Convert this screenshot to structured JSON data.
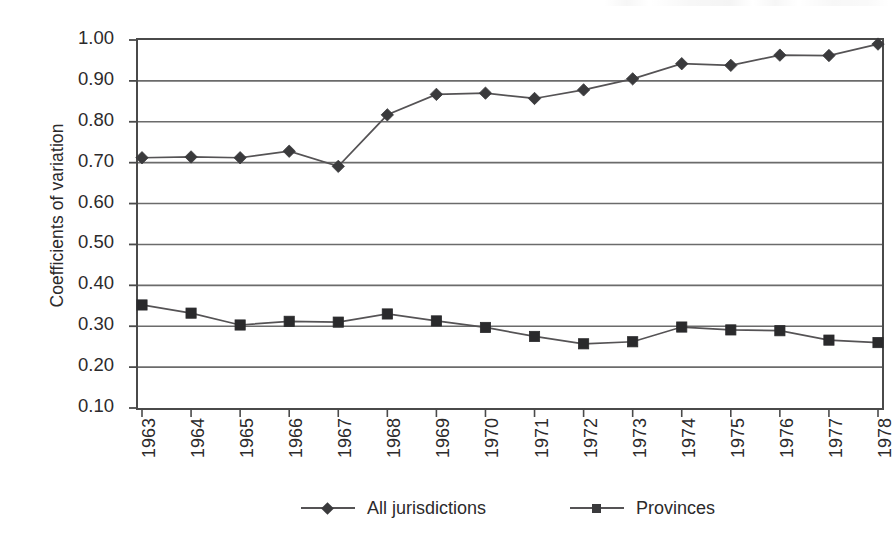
{
  "chart_data": {
    "type": "line",
    "title": "",
    "subtitle": "",
    "xlabel": "",
    "ylabel": "Coefficients of variation",
    "categories": [
      "1963",
      "1964",
      "1965",
      "1966",
      "1967",
      "1968",
      "1969",
      "1970",
      "1971",
      "1972",
      "1973",
      "1974",
      "1975",
      "1976",
      "1977",
      "1978"
    ],
    "x": [
      1963,
      1964,
      1965,
      1966,
      1967,
      1968,
      1969,
      1970,
      1971,
      1972,
      1973,
      1974,
      1975,
      1976,
      1977,
      1978
    ],
    "series": [
      {
        "name": "All jurisdictions",
        "marker": "diamond",
        "color": "#3a3a3c",
        "values": [
          0.712,
          0.714,
          0.712,
          0.728,
          0.691,
          0.817,
          0.867,
          0.87,
          0.857,
          0.878,
          0.905,
          0.942,
          0.938,
          0.963,
          0.962,
          0.99
        ]
      },
      {
        "name": "Provinces",
        "marker": "square",
        "color": "#2a2a2c",
        "values": [
          0.352,
          0.332,
          0.303,
          0.312,
          0.31,
          0.33,
          0.313,
          0.297,
          0.275,
          0.257,
          0.262,
          0.298,
          0.291,
          0.289,
          0.266,
          0.26
        ]
      }
    ],
    "ylim": [
      0.1,
      1.0
    ],
    "ytick_step": 0.1,
    "yticks": [
      "1.00",
      "0.90",
      "0.80",
      "0.70",
      "0.60",
      "0.50",
      "0.40",
      "0.30",
      "0.20",
      "0.10"
    ],
    "ytick_values": [
      1.0,
      0.9,
      0.8,
      0.7,
      0.6,
      0.5,
      0.4,
      0.3,
      0.2,
      0.1
    ],
    "grid": "horizontal",
    "legend_position": "bottom"
  },
  "legend": {
    "entries": [
      {
        "label": "All jurisdictions",
        "marker": "diamond"
      },
      {
        "label": "Provinces",
        "marker": "square"
      }
    ]
  },
  "colors": {
    "line": "#555355",
    "marker": "#3a3a3c",
    "axis": "#4a4a4a",
    "grid": "#6b6b6b",
    "text": "#2c2a2b",
    "background": "#ffffff"
  }
}
